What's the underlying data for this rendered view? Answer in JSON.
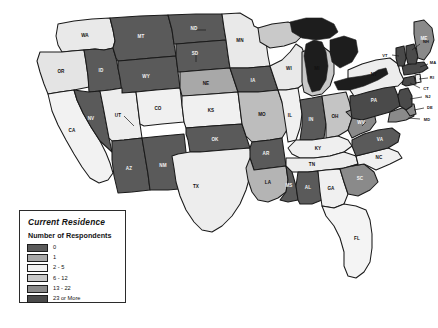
{
  "legend": {
    "title": "Current Residence",
    "subtitle": "Number of Respondents",
    "entries": [
      {
        "label": "0",
        "color": "#5a5a5a"
      },
      {
        "label": "1",
        "color": "#a8a8a8"
      },
      {
        "label": "2 - 5",
        "color": "#f2f2f2"
      },
      {
        "label": "6 - 12",
        "color": "#c9c9c9"
      },
      {
        "label": "13 - 22",
        "color": "#8a8a8a"
      },
      {
        "label": "23 or More",
        "color": "#4a4a4a"
      }
    ]
  },
  "chart_data": {
    "type": "choropleth-map",
    "title": "Current Residence",
    "legend_title": "Number of Respondents",
    "region": "United States",
    "bins": [
      "0",
      "1",
      "2 - 5",
      "6 - 12",
      "13 - 22",
      "23 or More"
    ],
    "bin_colors": [
      "#5a5a5a",
      "#a8a8a8",
      "#f2f2f2",
      "#c9c9c9",
      "#8a8a8a",
      "#4a4a4a"
    ],
    "states": [
      {
        "code": "WA",
        "bin": "2 - 5",
        "color": "#e9e9e9"
      },
      {
        "code": "OR",
        "bin": "2 - 5",
        "color": "#e4e4e4"
      },
      {
        "code": "CA",
        "bin": "2 - 5",
        "color": "#f2f2f2"
      },
      {
        "code": "ID",
        "bin": "0",
        "color": "#5a5a5a"
      },
      {
        "code": "NV",
        "bin": "0",
        "color": "#5a5a5a"
      },
      {
        "code": "MT",
        "bin": "0",
        "color": "#5a5a5a"
      },
      {
        "code": "WY",
        "bin": "0",
        "color": "#5a5a5a"
      },
      {
        "code": "UT",
        "bin": "2 - 5",
        "color": "#ededed"
      },
      {
        "code": "AZ",
        "bin": "0",
        "color": "#5a5a5a"
      },
      {
        "code": "CO",
        "bin": "2 - 5",
        "color": "#f0f0f0"
      },
      {
        "code": "NM",
        "bin": "0",
        "color": "#5a5a5a"
      },
      {
        "code": "ND",
        "bin": "0",
        "color": "#5a5a5a"
      },
      {
        "code": "SD",
        "bin": "0",
        "color": "#5a5a5a"
      },
      {
        "code": "NE",
        "bin": "1",
        "color": "#a8a8a8"
      },
      {
        "code": "KS",
        "bin": "2 - 5",
        "color": "#f0f0f0"
      },
      {
        "code": "OK",
        "bin": "0",
        "color": "#5a5a5a"
      },
      {
        "code": "TX",
        "bin": "2 - 5",
        "color": "#ededed"
      },
      {
        "code": "MN",
        "bin": "2 - 5",
        "color": "#e9e9e9"
      },
      {
        "code": "IA",
        "bin": "0",
        "color": "#5a5a5a"
      },
      {
        "code": "MO",
        "bin": "1",
        "color": "#bdbdbd"
      },
      {
        "code": "AR",
        "bin": "0",
        "color": "#5a5a5a"
      },
      {
        "code": "LA",
        "bin": "1",
        "color": "#b4b4b4"
      },
      {
        "code": "WI",
        "bin": "2 - 5",
        "color": "#e9e9e9"
      },
      {
        "code": "IL",
        "bin": "2 - 5",
        "color": "#f0f0f0"
      },
      {
        "code": "MI",
        "bin": "6 - 12",
        "color": "#c9c9c9"
      },
      {
        "code": "IN",
        "bin": "0",
        "color": "#5a5a5a"
      },
      {
        "code": "OH",
        "bin": "6 - 12",
        "color": "#c4c4c4"
      },
      {
        "code": "KY",
        "bin": "2 - 5",
        "color": "#efefef"
      },
      {
        "code": "TN",
        "bin": "2 - 5",
        "color": "#ededed"
      },
      {
        "code": "MS",
        "bin": "0",
        "color": "#5a5a5a"
      },
      {
        "code": "AL",
        "bin": "0",
        "color": "#5a5a5a"
      },
      {
        "code": "GA",
        "bin": "2 - 5",
        "color": "#f0f0f0"
      },
      {
        "code": "FL",
        "bin": "2 - 5",
        "color": "#f4f4f4"
      },
      {
        "code": "SC",
        "bin": "13 - 22",
        "color": "#8a8a8a"
      },
      {
        "code": "NC",
        "bin": "2 - 5",
        "color": "#f0f0f0"
      },
      {
        "code": "VA",
        "bin": "0",
        "color": "#5a5a5a"
      },
      {
        "code": "WV",
        "bin": "13 - 22",
        "color": "#8a8a8a"
      },
      {
        "code": "PA",
        "bin": "23 or More",
        "color": "#4a4a4a"
      },
      {
        "code": "MD",
        "bin": "13 - 22",
        "color": "#8a8a8a"
      },
      {
        "code": "DE",
        "bin": "13 - 22",
        "color": "#8a8a8a"
      },
      {
        "code": "NJ",
        "bin": "23 or More",
        "color": "#4a4a4a"
      },
      {
        "code": "NY",
        "bin": "2 - 5",
        "color": "#ededed"
      },
      {
        "code": "CT",
        "bin": "23 or More",
        "color": "#4a4a4a"
      },
      {
        "code": "RI",
        "bin": "2 - 5",
        "color": "#f2f2f2"
      },
      {
        "code": "MA",
        "bin": "23 or More",
        "color": "#4a4a4a"
      },
      {
        "code": "VT",
        "bin": "23 or More",
        "color": "#4a4a4a"
      },
      {
        "code": "NH",
        "bin": "23 or More",
        "color": "#4a4a4a"
      },
      {
        "code": "ME",
        "bin": "13 - 22",
        "color": "#8a8a8a"
      }
    ],
    "callout_labels": [
      "VT",
      "NH",
      "MA",
      "RI",
      "CT",
      "NJ",
      "DE",
      "MD"
    ]
  }
}
